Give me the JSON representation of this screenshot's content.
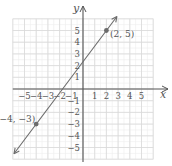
{
  "chart_data": {
    "type": "line",
    "title": "",
    "xlabel": "x",
    "ylabel": "y",
    "xlim": [
      -6,
      6
    ],
    "ylim": [
      -6,
      6
    ],
    "grid": true,
    "x_ticks": [
      -5,
      -4,
      -3,
      -2,
      -1,
      1,
      2,
      3,
      4,
      5
    ],
    "y_ticks": [
      5,
      4,
      3,
      2,
      1,
      -1,
      -2,
      -3,
      -4,
      -5
    ],
    "x_tick_labels": [
      "−5",
      "−4",
      "−3",
      "−2",
      "−1",
      "1",
      "2",
      "3",
      "4",
      "5"
    ],
    "y_tick_labels": [
      "5",
      "4",
      "3",
      "2",
      "1",
      "−1",
      "−2",
      "−3",
      "−4",
      "−5"
    ],
    "series": [
      {
        "name": "line through (2, 5) and (−4, −3)",
        "slope": 1.3333,
        "intercept": 2.3333,
        "points": [
          {
            "x": -4,
            "y": -3,
            "label": "(−4, −3)"
          },
          {
            "x": 2,
            "y": 5,
            "label": "(2, 5)"
          }
        ],
        "arrows": "both"
      }
    ],
    "annotations": [
      {
        "text": "(2, 5)",
        "x": 2,
        "y": 5
      },
      {
        "text": "(−4, −3)",
        "x": -4,
        "y": -3
      }
    ]
  },
  "labels": {
    "x_axis": "x",
    "y_axis": "y",
    "point_a": "(2, 5)",
    "point_b": "(−4, −3)"
  },
  "colors": {
    "grid": "#d9d9d9",
    "axis": "#555555",
    "line": "#6b6b6b",
    "point": "#6b6b6b",
    "text": "#555555"
  }
}
